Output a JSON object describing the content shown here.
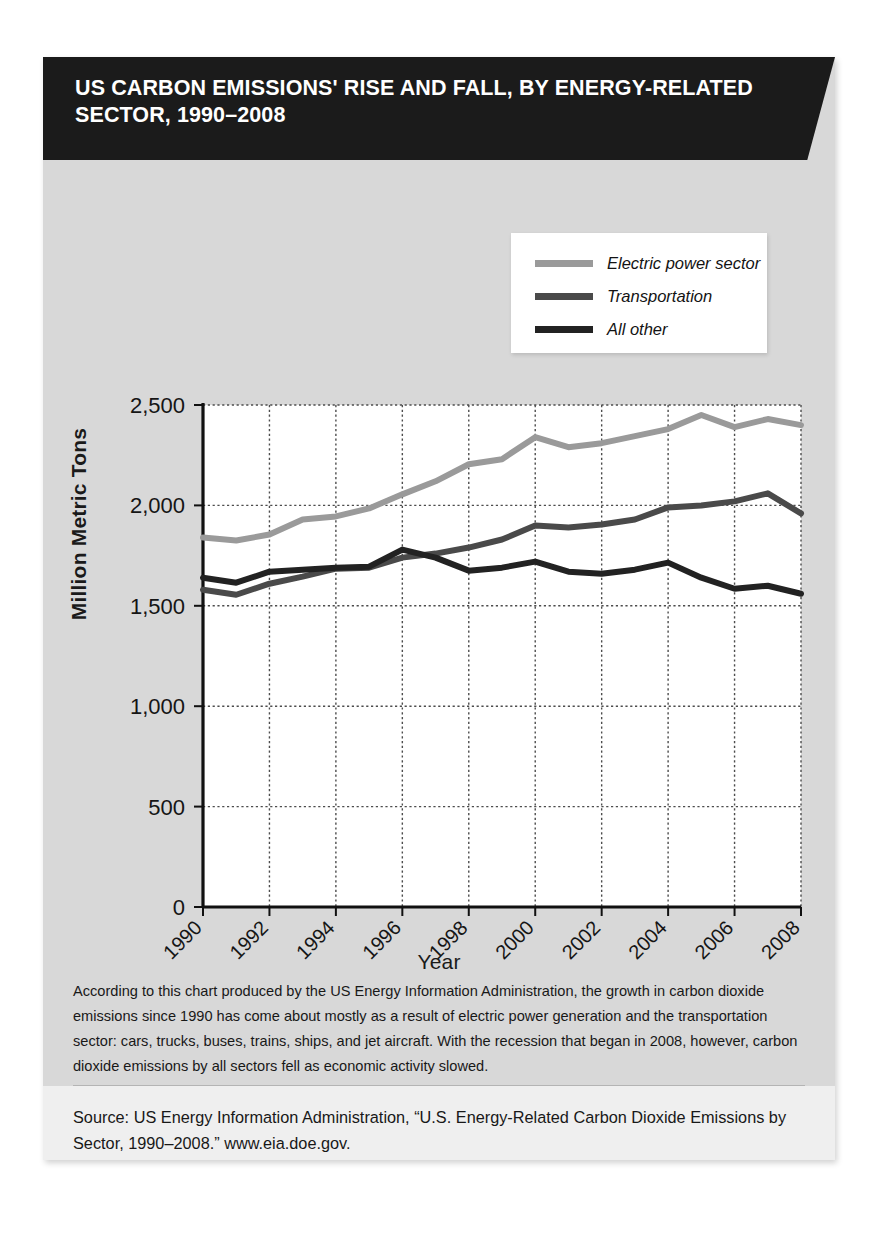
{
  "banner": {
    "title": "US CARBON EMISSIONS' RISE AND FALL, BY ENERGY-RELATED SECTOR, 1990–2008"
  },
  "caption": {
    "text": "According to this chart produced by the US Energy Information Administration, the growth in carbon dioxide emissions since 1990 has come about mostly as a result of electric power generation and the transportation sector: cars, trucks, buses, trains, ships, and jet aircraft. With the recession that began in 2008, however, carbon dioxide emissions by all sectors fell as economic activity slowed."
  },
  "source": {
    "text": "Source: US Energy Information Administration, “U.S. Energy-Related Carbon Dioxide Emissions by Sector, 1990–2008.”  www.eia.doe.gov."
  },
  "colors": {
    "banner_bg": "#1b1b1b",
    "card_bg": "#d8d8d8",
    "plot_bg": "#ffffff",
    "electric": "#9a9a9a",
    "transportation": "#4a4a4a",
    "all_other": "#222222",
    "grid": "#4d4d4d",
    "axis": "#111111"
  },
  "chart_data": {
    "type": "line",
    "title": "US Carbon Emissions' Rise and Fall, by Energy-Related Sector, 1990–2008",
    "xlabel": "Year",
    "ylabel": "Million Metric Tons",
    "x": [
      1990,
      1991,
      1992,
      1993,
      1994,
      1995,
      1996,
      1997,
      1998,
      1999,
      2000,
      2001,
      2002,
      2003,
      2004,
      2005,
      2006,
      2007,
      2008
    ],
    "xticklabels": [
      "1990",
      "1992",
      "1994",
      "1996",
      "1998",
      "2000",
      "2002",
      "2004",
      "2006",
      "2008"
    ],
    "xtickvalues": [
      1990,
      1992,
      1994,
      1996,
      1998,
      2000,
      2002,
      2004,
      2006,
      2008
    ],
    "yticklabels": [
      "0",
      "500",
      "1,000",
      "1,500",
      "2,000",
      "2,500"
    ],
    "ytickvalues": [
      0,
      500,
      1000,
      1500,
      2000,
      2500
    ],
    "xlim": [
      1990,
      2008
    ],
    "ylim": [
      0,
      2500
    ],
    "grid": true,
    "legend_position": "top-right",
    "series": [
      {
        "name": "Electric power sector",
        "color": "#9a9a9a",
        "values": [
          1840,
          1825,
          1855,
          1930,
          1945,
          1985,
          2055,
          2120,
          2205,
          2230,
          2340,
          2290,
          2310,
          2345,
          2380,
          2450,
          2390,
          2430,
          2400
        ]
      },
      {
        "name": "Transportation",
        "color": "#4a4a4a",
        "values": [
          1580,
          1555,
          1610,
          1645,
          1685,
          1690,
          1740,
          1760,
          1790,
          1830,
          1900,
          1890,
          1905,
          1930,
          1990,
          2000,
          2020,
          2060,
          1960
        ]
      },
      {
        "name": "All other",
        "color": "#222222",
        "values": [
          1640,
          1615,
          1670,
          1680,
          1690,
          1695,
          1780,
          1740,
          1675,
          1690,
          1720,
          1670,
          1660,
          1680,
          1715,
          1640,
          1585,
          1600,
          1560
        ]
      }
    ]
  }
}
